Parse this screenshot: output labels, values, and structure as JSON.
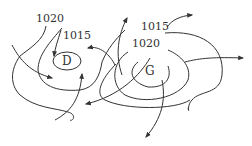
{
  "diagram": {
    "type": "isobar-pressure-map",
    "stroke_color": "#333333",
    "background": "#ffffff",
    "isobar_labels": [
      {
        "id": "label-1020-left",
        "text": "1020",
        "x": 36,
        "y": 22
      },
      {
        "id": "label-1015-left",
        "text": "1015",
        "x": 62,
        "y": 40
      },
      {
        "id": "label-1015-right",
        "text": "1015",
        "x": 140,
        "y": 30
      },
      {
        "id": "label-1020-right",
        "text": "1020",
        "x": 132,
        "y": 47
      }
    ],
    "centers": [
      {
        "id": "low-center",
        "text": "D",
        "x": 67,
        "y": 64
      },
      {
        "id": "high-center",
        "text": "G",
        "x": 150,
        "y": 71
      }
    ]
  }
}
